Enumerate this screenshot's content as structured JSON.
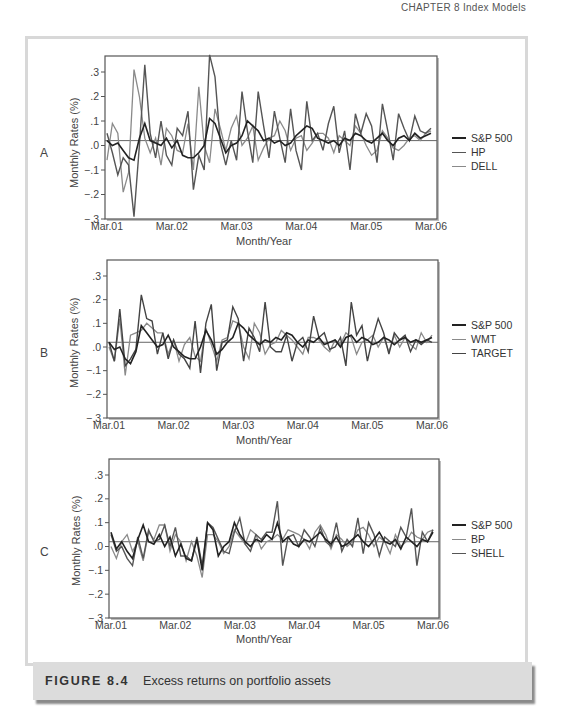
{
  "running_head": "CHAPTER 8   Index Models",
  "caption": {
    "label": "FIGURE 8.4",
    "text": "Excess returns on portfolio assets"
  },
  "chart_data": [
    {
      "type": "line",
      "panel": "A",
      "title": "",
      "xlabel": "Month/Year",
      "ylabel": "Monthly Rates (%)",
      "ylim": [
        -0.3,
        0.35
      ],
      "yticks": [
        ".3",
        ".2",
        ".1",
        ".0",
        "-.1",
        "-.2",
        "-.3"
      ],
      "ytick_values": [
        0.3,
        0.2,
        0.1,
        0.0,
        -0.1,
        -0.2,
        -0.3
      ],
      "xticks": [
        "Mar.01",
        "Mar.02",
        "Mar.03",
        "Mar.04",
        "Mar.05",
        "Mar.06"
      ],
      "reference_line": 0.02,
      "legend_position": "right",
      "series": [
        {
          "name": "S&P 500",
          "color": "#222222",
          "width": 1.6,
          "values": [
            0.02,
            0.0,
            0.01,
            -0.02,
            -0.05,
            -0.06,
            0.03,
            0.09,
            0.02,
            0.01,
            0.0,
            0.03,
            -0.01,
            0.02,
            -0.04,
            -0.05,
            -0.05,
            -0.03,
            0.0,
            0.11,
            0.09,
            0.03,
            -0.03,
            0.0,
            0.01,
            0.04,
            0.1,
            0.08,
            0.06,
            0.02,
            0.03,
            0.01,
            0.02,
            0.0,
            0.01,
            0.04,
            0.06,
            0.08,
            0.07,
            0.03,
            0.02,
            0.01,
            0.02,
            0.0,
            0.03,
            0.02,
            0.05,
            0.04,
            0.02,
            0.01,
            0.03,
            0.05,
            0.02,
            0.0,
            0.03,
            0.04,
            0.02,
            0.05,
            0.03,
            0.04,
            0.05
          ]
        },
        {
          "name": "HP",
          "color": "#555555",
          "width": 1.4,
          "values": [
            0.05,
            -0.03,
            -0.12,
            -0.05,
            -0.08,
            -0.29,
            0.0,
            0.33,
            0.05,
            -0.05,
            0.1,
            -0.04,
            -0.08,
            0.07,
            0.04,
            0.14,
            -0.18,
            -0.04,
            -0.1,
            0.37,
            0.28,
            0.01,
            -0.08,
            0.02,
            -0.06,
            0.22,
            0.06,
            -0.07,
            0.22,
            0.08,
            -0.05,
            0.14,
            0.03,
            -0.07,
            0.15,
            -0.02,
            -0.1,
            0.18,
            0.02,
            0.05,
            -0.02,
            0.09,
            0.16,
            -0.03,
            0.06,
            -0.1,
            0.13,
            0.05,
            0.13,
            0.08,
            -0.07,
            0.17,
            0.06,
            -0.06,
            0.13,
            0.07,
            0.02,
            0.12,
            0.06,
            0.05,
            0.07
          ]
        },
        {
          "name": "DELL",
          "color": "#8a8a8a",
          "width": 1.3,
          "values": [
            -0.06,
            0.09,
            0.05,
            -0.19,
            -0.11,
            0.31,
            0.2,
            0.03,
            -0.03,
            0.03,
            -0.08,
            0.07,
            0.04,
            -0.02,
            -0.03,
            0.09,
            -0.1,
            0.24,
            0.0,
            -0.07,
            0.15,
            0.07,
            -0.02,
            0.07,
            0.12,
            0.0,
            0.03,
            0.08,
            -0.06,
            -0.01,
            0.03,
            0.04,
            0.1,
            0.06,
            -0.02,
            0.03,
            0.04,
            -0.02,
            0.01,
            0.05,
            0.05,
            0.03,
            -0.03,
            0.04,
            0.02,
            0.0,
            0.08,
            0.05,
            0.0,
            -0.04,
            -0.02,
            0.06,
            0.03,
            -0.01,
            -0.02,
            0.0,
            0.03,
            0.04,
            0.02,
            0.05,
            0.06
          ]
        }
      ]
    },
    {
      "type": "line",
      "panel": "B",
      "title": "",
      "xlabel": "Month/Year",
      "ylabel": "Monthly Rates (%)",
      "ylim": [
        -0.3,
        0.35
      ],
      "yticks": [
        ".3",
        ".2",
        ".1",
        ".0",
        "-.1",
        "-.2",
        "-.3"
      ],
      "ytick_values": [
        0.3,
        0.2,
        0.1,
        0.0,
        -0.1,
        -0.2,
        -0.3
      ],
      "xticks": [
        "Mar.01",
        "Mar.02",
        "Mar.03",
        "Mar.04",
        "Mar.05",
        "Mar.06"
      ],
      "reference_line": 0.02,
      "legend_position": "right",
      "series": [
        {
          "name": "S&P 500",
          "color": "#222222",
          "width": 1.6,
          "values": [
            0.02,
            -0.01,
            0.0,
            -0.05,
            -0.07,
            -0.02,
            0.09,
            0.06,
            0.03,
            0.0,
            0.01,
            0.05,
            0.0,
            -0.02,
            -0.04,
            -0.05,
            -0.05,
            0.0,
            0.07,
            0.03,
            -0.03,
            -0.01,
            0.02,
            0.04,
            0.1,
            0.08,
            0.05,
            0.03,
            0.01,
            0.03,
            0.02,
            0.04,
            0.03,
            0.06,
            0.05,
            0.02,
            0.0,
            0.03,
            0.02,
            0.04,
            0.01,
            0.02,
            0.03,
            0.0,
            0.04,
            0.05,
            0.02,
            0.04,
            0.03,
            0.01,
            0.02,
            0.04,
            0.03,
            0.01,
            0.03,
            0.04,
            0.02,
            0.03,
            0.02,
            0.03,
            0.04
          ]
        },
        {
          "name": "WMT",
          "color": "#8a8a8a",
          "width": 1.3,
          "values": [
            0.0,
            -0.06,
            0.12,
            -0.12,
            0.05,
            0.06,
            0.07,
            0.1,
            0.08,
            0.06,
            0.06,
            -0.03,
            0.03,
            -0.06,
            0.01,
            0.04,
            -0.04,
            -0.06,
            0.08,
            0.01,
            -0.06,
            0.03,
            0.04,
            0.11,
            0.1,
            0.0,
            -0.05,
            0.1,
            0.06,
            -0.03,
            0.01,
            0.02,
            0.07,
            0.05,
            0.03,
            0.0,
            -0.03,
            0.04,
            0.04,
            0.03,
            0.0,
            -0.02,
            0.03,
            0.01,
            0.06,
            0.04,
            -0.03,
            0.02,
            0.03,
            0.05,
            0.0,
            0.04,
            -0.02,
            0.05,
            0.0,
            0.04,
            0.01,
            -0.01,
            0.06,
            0.02,
            0.05
          ]
        },
        {
          "name": "TARGET",
          "color": "#444444",
          "width": 1.4,
          "values": [
            0.02,
            -0.06,
            0.16,
            -0.08,
            -0.05,
            -0.01,
            0.22,
            0.12,
            0.11,
            -0.03,
            0.06,
            -0.05,
            0.03,
            -0.03,
            -0.05,
            -0.09,
            0.11,
            -0.11,
            0.1,
            0.18,
            -0.1,
            0.02,
            0.03,
            0.17,
            0.12,
            -0.06,
            0.08,
            0.04,
            -0.02,
            0.19,
            0.0,
            -0.02,
            -0.02,
            0.05,
            -0.06,
            0.02,
            0.04,
            -0.02,
            0.13,
            0.04,
            0.06,
            -0.01,
            0.0,
            0.04,
            -0.08,
            0.19,
            0.05,
            0.09,
            -0.06,
            0.04,
            0.12,
            0.06,
            -0.03,
            0.06,
            0.03,
            0.05,
            -0.02,
            0.03,
            0.01,
            0.03,
            0.02
          ]
        }
      ]
    },
    {
      "type": "line",
      "panel": "C",
      "title": "",
      "xlabel": "Month/Year",
      "ylabel": "Monthly Rates (%)",
      "ylim": [
        -0.3,
        0.35
      ],
      "yticks": [
        ".3",
        ".2",
        ".1",
        ".0",
        "-.1",
        "-.2",
        "-.3"
      ],
      "ytick_values": [
        0.3,
        0.2,
        0.1,
        0.0,
        -0.1,
        -0.2,
        -0.3
      ],
      "xticks": [
        "Mar.01",
        "Mar.02",
        "Mar.03",
        "Mar.04",
        "Mar.05",
        "Mar.06"
      ],
      "reference_line": 0.02,
      "legend_position": "right",
      "series": [
        {
          "name": "S&P 500",
          "color": "#222222",
          "width": 1.6,
          "values": [
            0.06,
            -0.01,
            0.02,
            -0.02,
            -0.05,
            0.03,
            0.09,
            0.02,
            0.01,
            0.05,
            0.0,
            0.04,
            -0.04,
            0.01,
            -0.05,
            -0.06,
            0.03,
            -0.1,
            0.1,
            0.07,
            -0.04,
            0.0,
            0.02,
            0.1,
            0.05,
            0.02,
            0.0,
            0.03,
            0.02,
            0.05,
            0.03,
            0.1,
            0.02,
            0.04,
            0.01,
            0.0,
            0.03,
            0.02,
            0.04,
            0.06,
            0.03,
            0.01,
            0.04,
            0.0,
            0.01,
            0.03,
            0.05,
            0.02,
            0.0,
            0.03,
            0.06,
            0.02,
            0.01,
            0.03,
            -0.01,
            0.04,
            0.02,
            0.0,
            0.03,
            0.02,
            0.06
          ]
        },
        {
          "name": "BP",
          "color": "#8a8a8a",
          "width": 1.3,
          "values": [
            0.0,
            -0.05,
            0.02,
            0.05,
            -0.02,
            0.02,
            -0.06,
            0.06,
            0.03,
            0.09,
            0.09,
            -0.02,
            0.05,
            0.02,
            -0.06,
            0.02,
            -0.04,
            -0.13,
            0.05,
            0.05,
            0.02,
            -0.03,
            0.0,
            0.07,
            0.04,
            0.01,
            0.07,
            0.05,
            -0.01,
            0.02,
            0.03,
            0.05,
            0.03,
            0.07,
            0.06,
            0.05,
            0.03,
            -0.01,
            0.06,
            0.09,
            0.05,
            -0.01,
            0.05,
            0.03,
            0.0,
            0.02,
            0.07,
            0.08,
            0.05,
            0.0,
            0.04,
            0.02,
            -0.03,
            0.05,
            0.0,
            0.02,
            0.06,
            0.04,
            0.03,
            0.06,
            0.07
          ]
        },
        {
          "name": "SHELL",
          "color": "#555555",
          "width": 1.4,
          "values": [
            0.05,
            -0.02,
            0.0,
            -0.05,
            -0.08,
            0.04,
            -0.05,
            0.07,
            0.02,
            0.03,
            0.09,
            0.0,
            0.08,
            -0.04,
            -0.04,
            -0.06,
            0.04,
            -0.08,
            0.1,
            0.08,
            0.03,
            -0.02,
            -0.03,
            0.06,
            0.12,
            0.01,
            -0.02,
            0.05,
            0.03,
            0.06,
            0.06,
            0.19,
            -0.08,
            0.04,
            0.05,
            0.0,
            0.07,
            0.04,
            0.0,
            0.08,
            0.02,
            0.0,
            0.1,
            -0.02,
            0.03,
            0.0,
            0.12,
            -0.03,
            0.1,
            0.05,
            -0.04,
            0.04,
            0.02,
            0.0,
            0.08,
            0.04,
            0.16,
            -0.08,
            0.06,
            0.02,
            0.07
          ]
        }
      ]
    }
  ],
  "panels": [
    {
      "letter": "A",
      "ylabel": "Monthly Rates (%)",
      "xlabel": "Month/Year",
      "legend": [
        "S&P 500",
        "HP",
        "DELL"
      ]
    },
    {
      "letter": "B",
      "ylabel": "Monthly Rates (%)",
      "xlabel": "Month/Year",
      "legend": [
        "S&P 500",
        "WMT",
        "TARGET"
      ]
    },
    {
      "letter": "C",
      "ylabel": "Monthly Rates (%)",
      "xlabel": "Month/Year",
      "legend": [
        "S&P 500",
        "BP",
        "SHELL"
      ]
    }
  ]
}
